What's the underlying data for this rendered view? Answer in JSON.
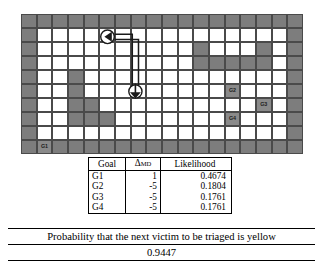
{
  "map": {
    "rows": 10,
    "cols": 18,
    "colors": {
      "free": "#ffffff",
      "wall": "#7d7d7d",
      "goal": "#8a8a8a",
      "border": "#5f5f5f",
      "gridline": "#4a4a4a"
    },
    "goals": [
      {
        "id": "G1",
        "label": "G1",
        "row": 9,
        "col": 1
      },
      {
        "id": "G2",
        "label": "G2",
        "row": 5,
        "col": 13
      },
      {
        "id": "G3",
        "label": "G3",
        "row": 6,
        "col": 15
      },
      {
        "id": "G4",
        "label": "G4",
        "row": 7,
        "col": 13
      }
    ],
    "walls": [
      [
        0,
        0
      ],
      [
        0,
        1
      ],
      [
        0,
        2
      ],
      [
        0,
        3
      ],
      [
        0,
        4
      ],
      [
        0,
        5
      ],
      [
        0,
        6
      ],
      [
        0,
        7
      ],
      [
        0,
        8
      ],
      [
        0,
        9
      ],
      [
        0,
        10
      ],
      [
        0,
        11
      ],
      [
        0,
        12
      ],
      [
        0,
        13
      ],
      [
        0,
        14
      ],
      [
        0,
        15
      ],
      [
        0,
        16
      ],
      [
        0,
        17
      ],
      [
        1,
        0
      ],
      [
        1,
        17
      ],
      [
        2,
        0
      ],
      [
        2,
        11
      ],
      [
        2,
        15
      ],
      [
        2,
        17
      ],
      [
        3,
        0
      ],
      [
        3,
        11
      ],
      [
        3,
        12
      ],
      [
        3,
        13
      ],
      [
        3,
        14
      ],
      [
        3,
        15
      ],
      [
        3,
        17
      ],
      [
        4,
        0
      ],
      [
        4,
        3
      ],
      [
        4,
        17
      ],
      [
        5,
        0
      ],
      [
        5,
        3
      ],
      [
        5,
        17
      ],
      [
        6,
        0
      ],
      [
        6,
        3
      ],
      [
        6,
        4
      ],
      [
        6,
        17
      ],
      [
        7,
        0
      ],
      [
        7,
        3
      ],
      [
        7,
        4
      ],
      [
        7,
        5
      ],
      [
        7,
        17
      ],
      [
        8,
        0
      ],
      [
        8,
        17
      ],
      [
        9,
        0
      ],
      [
        9,
        1
      ],
      [
        9,
        2
      ],
      [
        9,
        3
      ],
      [
        9,
        4
      ],
      [
        9,
        5
      ],
      [
        9,
        6
      ],
      [
        9,
        7
      ],
      [
        9,
        8
      ],
      [
        9,
        9
      ],
      [
        9,
        10
      ],
      [
        9,
        11
      ],
      [
        9,
        12
      ],
      [
        9,
        13
      ],
      [
        9,
        14
      ],
      [
        9,
        15
      ],
      [
        9,
        16
      ],
      [
        9,
        17
      ]
    ],
    "agent_path": {
      "start_marker": "down-arrow-circle",
      "end_marker": "left-arrow-circle",
      "start_row": 5,
      "start_col": 7,
      "end_row": 1,
      "end_col": 5
    }
  },
  "table": {
    "headers": {
      "goal": "Goal",
      "dmd_base": "Δ",
      "dmd_sub": "MD",
      "likelihood": "Likelihood"
    },
    "rows": [
      {
        "goal": "G1",
        "dmd": "1",
        "likelihood": "0.4674"
      },
      {
        "goal": "G2",
        "dmd": "-5",
        "likelihood": "0.1804"
      },
      {
        "goal": "G3",
        "dmd": "-5",
        "likelihood": "0.1761"
      },
      {
        "goal": "G4",
        "dmd": "-5",
        "likelihood": "0.1761"
      }
    ]
  },
  "footer": {
    "question": "Probability that the next victim to be triaged is yellow",
    "answer": "0.9447"
  },
  "chart_data": {
    "type": "table",
    "categories": [
      "G1",
      "G2",
      "G3",
      "G4"
    ],
    "series": [
      {
        "name": "ΔMD",
        "values": [
          1,
          -5,
          -5,
          -5
        ]
      },
      {
        "name": "Likelihood",
        "values": [
          0.4674,
          0.1804,
          0.1761,
          0.1761
        ]
      }
    ],
    "annotations": [
      {
        "text": "Probability that the next victim to be triaged is yellow",
        "value": 0.9447
      }
    ],
    "xlabel": "Goal",
    "ylabel": "Likelihood",
    "ylim": [
      0,
      1
    ],
    "grid": false,
    "legend": "none"
  }
}
